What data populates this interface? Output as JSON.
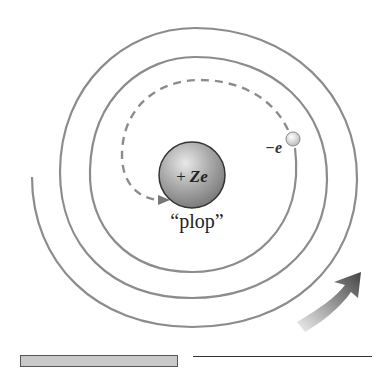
{
  "figure": {
    "type": "atomic-collapse-diagram",
    "nucleus": {
      "label_sign": "+",
      "label_charge": "Ze",
      "color": "#9a9a9a"
    },
    "electron": {
      "label": "−e",
      "color": "#e0e0e0"
    },
    "event_label": "“plop”",
    "spiral_color": "#8c8c8c",
    "dashed_path_color": "#8c8c8c",
    "motion_arrow": {
      "direction": "counterclockwise",
      "gradient_from": "#e6e6e6",
      "gradient_to": "#4a4a4a"
    }
  }
}
